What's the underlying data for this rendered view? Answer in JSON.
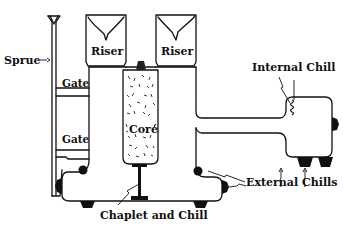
{
  "diagram": {
    "title": "",
    "colors": {
      "ink": "#111111",
      "background": "#ffffff"
    },
    "labels": {
      "sprue": "Sprue",
      "gate_upper": "Gate",
      "gate_lower": "Gate",
      "riser_left": "Riser",
      "riser_right": "Riser",
      "core": "Coré",
      "internal_chill": "Internal Chill",
      "external_chills": "External Chills",
      "chaplet_and_chill": "Chaplet and Chill"
    },
    "components": [
      "sprue",
      "gate",
      "gate",
      "riser",
      "riser",
      "core",
      "internal-chill",
      "external-chills",
      "chaplet-and-chill"
    ]
  }
}
